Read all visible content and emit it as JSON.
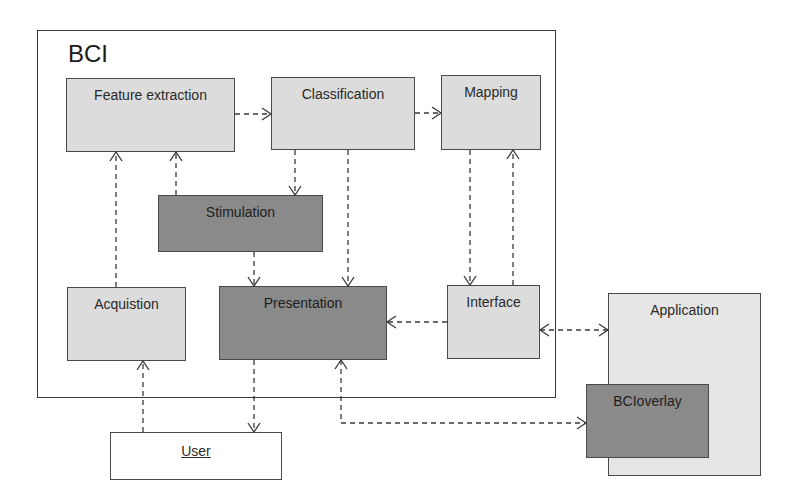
{
  "diagram": {
    "frame": {
      "title": "BCI"
    },
    "nodes": {
      "feature_extraction": {
        "label": "Feature extraction"
      },
      "classification": {
        "label": "Classification"
      },
      "mapping": {
        "label": "Mapping"
      },
      "stimulation": {
        "label": "Stimulation"
      },
      "acquisition": {
        "label": "Acquistion"
      },
      "presentation": {
        "label": "Presentation"
      },
      "interface": {
        "label": "Interface"
      },
      "application": {
        "label": "Application"
      },
      "bcioverlay": {
        "label": "BCIoverlay"
      },
      "user": {
        "label": "User"
      }
    },
    "edges": [
      {
        "from": "Feature extraction",
        "to": "Classification",
        "style": "dashed-arrow"
      },
      {
        "from": "Classification",
        "to": "Mapping",
        "style": "dashed-arrow"
      },
      {
        "from": "Classification",
        "to": "Stimulation",
        "style": "dashed-arrow"
      },
      {
        "from": "Classification",
        "to": "Presentation",
        "style": "dashed-arrow"
      },
      {
        "from": "Stimulation",
        "to": "Feature extraction",
        "style": "dashed-arrow"
      },
      {
        "from": "Stimulation",
        "to": "Presentation",
        "style": "dashed-arrow"
      },
      {
        "from": "Acquistion",
        "to": "Feature extraction",
        "style": "dashed-arrow"
      },
      {
        "from": "Mapping",
        "to": "Interface",
        "style": "dashed-arrow"
      },
      {
        "from": "Interface",
        "to": "Mapping",
        "style": "dashed-arrow"
      },
      {
        "from": "Interface",
        "to": "Presentation",
        "style": "dashed-arrow"
      },
      {
        "from": "Interface",
        "to": "Application",
        "style": "dashed-bidirectional"
      },
      {
        "from": "User",
        "to": "Acquistion",
        "style": "dashed-arrow"
      },
      {
        "from": "Presentation",
        "to": "User",
        "style": "dashed-arrow"
      },
      {
        "from": "Presentation",
        "to": "BCIoverlay",
        "style": "dashed-bidirectional"
      }
    ],
    "colors": {
      "light_box": "#dcdcdc",
      "dark_box": "#8a8a8a",
      "border": "#4a4a4a"
    }
  }
}
